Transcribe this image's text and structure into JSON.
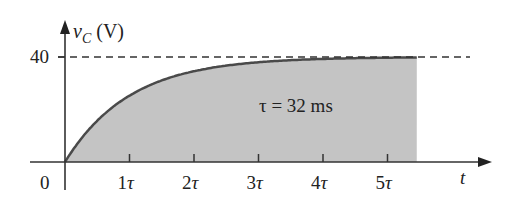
{
  "chart_data": {
    "type": "area",
    "title": "",
    "xlabel": "t",
    "ylabel": "v_C (V)",
    "ylabel_parts": {
      "var": "v",
      "sub": "C",
      "unit": "(V)"
    },
    "annotation": "τ = 32 ms",
    "origin_label": "0",
    "x_ticks": [
      "1τ",
      "2τ",
      "3τ",
      "4τ",
      "5τ"
    ],
    "y_ticks": [
      "40"
    ],
    "asymptote": {
      "value": 40,
      "style": "dashed"
    },
    "equation": "v_C = 40(1 - e^(-t/τ))",
    "x": [
      0,
      0.5,
      1,
      1.5,
      2,
      2.5,
      3,
      3.5,
      4,
      4.5,
      5,
      5.5
    ],
    "values": [
      0,
      15.74,
      25.28,
      31.07,
      34.59,
      36.72,
      38.01,
      38.79,
      39.27,
      39.56,
      39.73,
      39.84
    ],
    "xlim": [
      0,
      5.5
    ],
    "ylim": [
      0,
      40
    ],
    "fill": "#c2c2c2",
    "line_color": "#4a4a4a",
    "grid": false
  }
}
